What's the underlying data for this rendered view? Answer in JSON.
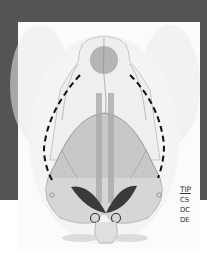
{
  "figure": {
    "colors": {
      "frame": "#545454",
      "panel": "#fbfbfb",
      "soft_tissue": "#e6e6e6",
      "bone_shade": "#bdbdbd",
      "circle": "#b5b5b5",
      "dark_wedge": "#3a3a3a",
      "dashed_line": "#111111"
    }
  },
  "legend": {
    "title": "TIP",
    "items": [
      "CS",
      "DC",
      "DE"
    ]
  }
}
